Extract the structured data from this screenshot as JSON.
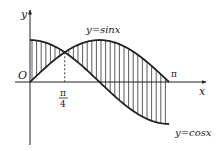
{
  "figure": {
    "axes": {
      "x_label": "x",
      "y_label": "y",
      "origin_label": "O"
    },
    "curves": [
      {
        "name": "sin",
        "label": "y=sinx"
      },
      {
        "name": "cos",
        "label": "y=cosx"
      }
    ],
    "ticks": {
      "quarter_pi_numerator": "π",
      "quarter_pi_denominator": "4",
      "pi": "π"
    },
    "colors": {
      "line": "#222222",
      "background": "#ffffff"
    }
  }
}
